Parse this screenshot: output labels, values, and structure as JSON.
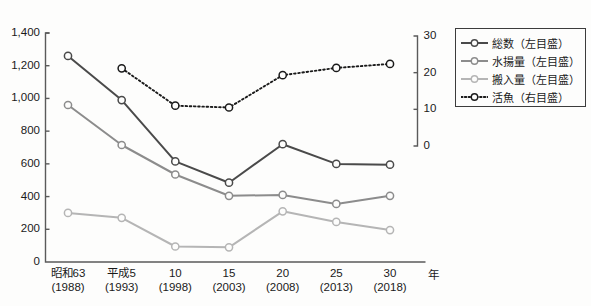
{
  "axes": {
    "left_unit": "万トン",
    "right_unit": "万トン",
    "x_unit": "年",
    "left_ticks": [
      "1,400",
      "1,200",
      "1,000",
      "800",
      "600",
      "400",
      "200",
      "0"
    ],
    "right_ticks": [
      "30",
      "20",
      "10",
      "0"
    ],
    "x_labels": [
      {
        "era": "昭和63",
        "year": "(1988)"
      },
      {
        "era": "平成5",
        "year": "(1993)"
      },
      {
        "era": "10",
        "year": "(1998)"
      },
      {
        "era": "15",
        "year": "(2003)"
      },
      {
        "era": "20",
        "year": "(2008)"
      },
      {
        "era": "25",
        "year": "(2013)"
      },
      {
        "era": "30",
        "year": "(2018)"
      }
    ]
  },
  "legend": {
    "items": [
      {
        "label": "総数（左目盛）",
        "color": "#4a4a4a",
        "style": "solid"
      },
      {
        "label": "水揚量（左目盛）",
        "color": "#8c8c8c",
        "style": "solid"
      },
      {
        "label": "搬入量（左目盛）",
        "color": "#b5b5b5",
        "style": "solid"
      },
      {
        "label": "活魚（右目盛）",
        "color": "#1a1a1a",
        "style": "dotted"
      }
    ]
  },
  "colors": {
    "total": "#4a4a4a",
    "landed": "#8c8c8c",
    "carried": "#b5b5b5",
    "live": "#1a1a1a",
    "axis": "#5a5a5a",
    "background": "#fdfdfc"
  },
  "chart_data": {
    "type": "line",
    "title": "",
    "xlabel": "年",
    "ylabel": "万トン",
    "y2label": "万トン",
    "ylim": [
      0,
      1400
    ],
    "y2lim": [
      0,
      30
    ],
    "grid": false,
    "legend_position": "top-right",
    "categories": [
      "昭和63(1988)",
      "平成5(1993)",
      "10(1998)",
      "15(2003)",
      "20(2008)",
      "25(2013)",
      "30(2018)"
    ],
    "x": [
      1988,
      1993,
      1998,
      2003,
      2008,
      2013,
      2018
    ],
    "series": [
      {
        "name": "総数（左目盛）",
        "axis": "left",
        "values": [
          1260,
          990,
          615,
          485,
          720,
          600,
          595
        ]
      },
      {
        "name": "水揚量（左目盛）",
        "axis": "left",
        "values": [
          960,
          715,
          535,
          405,
          410,
          355,
          405
        ]
      },
      {
        "name": "搬入量（左目盛）",
        "axis": "left",
        "values": [
          300,
          270,
          95,
          90,
          310,
          245,
          195
        ]
      },
      {
        "name": "活魚（右目盛）",
        "axis": "right",
        "values": [
          null,
          21.2,
          11.0,
          10.5,
          19.3,
          21.3,
          22.4
        ]
      }
    ]
  }
}
